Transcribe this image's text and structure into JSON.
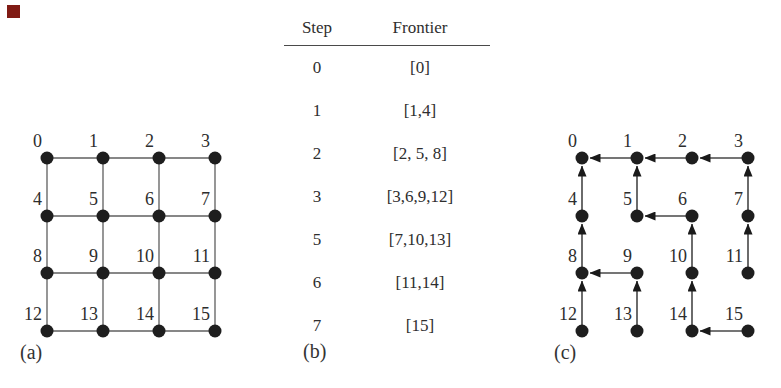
{
  "figure": {
    "colors": {
      "background": "#ffffff",
      "ink": "#2d2d2d",
      "node": "#1e1e1e",
      "grid_edge": "#5f5f5f",
      "tree_edge": "#474747",
      "arrowhead": "#1a1a1a",
      "table_rule": "#4a4a4a",
      "corner_marker": "#801b14"
    },
    "panel_a": {
      "caption": "(a)",
      "graph": {
        "type": "undirected-grid",
        "node_labels": [
          "0",
          "1",
          "2",
          "3",
          "4",
          "5",
          "6",
          "7",
          "8",
          "9",
          "10",
          "11",
          "12",
          "13",
          "14",
          "15"
        ],
        "edges": [
          [
            0,
            1
          ],
          [
            1,
            2
          ],
          [
            2,
            3
          ],
          [
            4,
            5
          ],
          [
            5,
            6
          ],
          [
            6,
            7
          ],
          [
            8,
            9
          ],
          [
            9,
            10
          ],
          [
            10,
            11
          ],
          [
            12,
            13
          ],
          [
            13,
            14
          ],
          [
            14,
            15
          ],
          [
            0,
            4
          ],
          [
            4,
            8
          ],
          [
            8,
            12
          ],
          [
            1,
            5
          ],
          [
            5,
            9
          ],
          [
            9,
            13
          ],
          [
            2,
            6
          ],
          [
            6,
            10
          ],
          [
            10,
            14
          ],
          [
            3,
            7
          ],
          [
            7,
            11
          ],
          [
            11,
            15
          ]
        ]
      }
    },
    "panel_b": {
      "caption": "(b)",
      "table": {
        "headers": [
          "Step",
          "Frontier"
        ],
        "rows": [
          {
            "step": "0",
            "frontier": "[0]"
          },
          {
            "step": "1",
            "frontier": "[1,4]"
          },
          {
            "step": "2",
            "frontier": "[2, 5, 8]"
          },
          {
            "step": "3",
            "frontier": "[3,6,9,12]"
          },
          {
            "step": "5",
            "frontier": "[7,10,13]"
          },
          {
            "step": "6",
            "frontier": "[11,14]"
          },
          {
            "step": "7",
            "frontier": "[15]"
          }
        ]
      }
    },
    "panel_c": {
      "caption": "(c)",
      "graph": {
        "type": "directed-bfs-tree",
        "node_labels": [
          "0",
          "1",
          "2",
          "3",
          "4",
          "5",
          "6",
          "7",
          "8",
          "9",
          "10",
          "11",
          "12",
          "13",
          "14",
          "15"
        ],
        "edges_child_to_parent": [
          [
            1,
            0
          ],
          [
            2,
            1
          ],
          [
            3,
            2
          ],
          [
            4,
            0
          ],
          [
            5,
            1
          ],
          [
            6,
            5
          ],
          [
            7,
            3
          ],
          [
            8,
            4
          ],
          [
            9,
            8
          ],
          [
            10,
            6
          ],
          [
            11,
            7
          ],
          [
            12,
            8
          ],
          [
            13,
            9
          ],
          [
            14,
            10
          ],
          [
            15,
            14
          ]
        ]
      }
    }
  }
}
